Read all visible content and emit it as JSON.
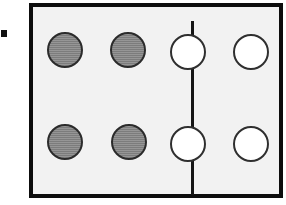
{
  "canvas": {
    "width": 286,
    "height": 205,
    "background_color": "#ffffff"
  },
  "edge_marker": {
    "label": "",
    "shape": "square",
    "color": "#111111",
    "x": 1,
    "y": 30,
    "size": 6
  },
  "frame": {
    "label": "",
    "fill_color": "#f2f2f2",
    "border_color": "#0d0d0d",
    "border_width": 4,
    "x": 29,
    "y": 3,
    "width": 254,
    "height": 195
  },
  "divider": {
    "label": "",
    "color": "#151515",
    "orientation": "vertical",
    "x": 158,
    "y": 14,
    "width": 3,
    "height": 174
  },
  "groups": [
    {
      "name": "left-group",
      "side": "left",
      "style": "filled",
      "count": 4,
      "fill_color": "#8a8a8a",
      "outline_color": "#2b2b2b",
      "tokens": [
        {
          "label": "",
          "x": 47,
          "y": 32,
          "size": 36
        },
        {
          "label": "",
          "x": 110,
          "y": 32,
          "size": 36
        },
        {
          "label": "",
          "x": 47,
          "y": 124,
          "size": 36
        },
        {
          "label": "",
          "x": 111,
          "y": 124,
          "size": 36
        }
      ]
    },
    {
      "name": "right-group",
      "side": "right",
      "style": "open",
      "count": 4,
      "fill_color": "#ffffff",
      "outline_color": "#2f2f2f",
      "tokens": [
        {
          "label": "",
          "x": 170,
          "y": 34,
          "size": 36
        },
        {
          "label": "",
          "x": 233,
          "y": 34,
          "size": 36
        },
        {
          "label": "",
          "x": 170,
          "y": 126,
          "size": 36
        },
        {
          "label": "",
          "x": 233,
          "y": 126,
          "size": 36
        }
      ]
    }
  ]
}
